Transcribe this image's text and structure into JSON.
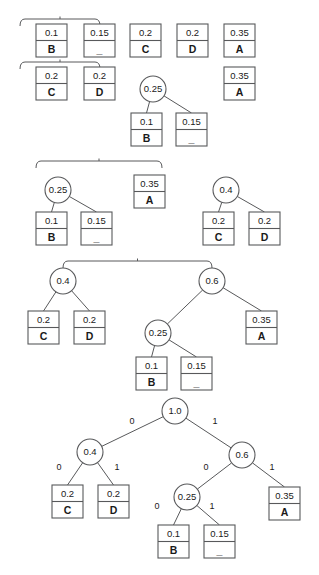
{
  "diagram": {
    "symbols": [
      "A",
      "B",
      "C",
      "D",
      "_"
    ],
    "probabilities": {
      "A": "0.35",
      "B": "0.1",
      "C": "0.2",
      "D": "0.2",
      "_": "0.15"
    },
    "edge_label_left": "0",
    "edge_label_right": "1",
    "colors": {
      "stroke": "#58595b",
      "text": "#1a1a1a",
      "background": "#ffffff"
    }
  },
  "steps": [
    {
      "step": 1,
      "name": "initial-symbol-list",
      "leaves": [
        {
          "prob": "0.1",
          "sym": "B",
          "x": 36,
          "y": 24
        },
        {
          "prob": "0.15",
          "sym": "_",
          "x": 84,
          "y": 24
        },
        {
          "prob": "0.2",
          "sym": "C",
          "x": 130,
          "y": 24
        },
        {
          "prob": "0.2",
          "sym": "D",
          "x": 177,
          "y": 24
        },
        {
          "prob": "0.35",
          "sym": "A",
          "x": 224,
          "y": 24
        }
      ],
      "brace": {
        "x1": 20,
        "x2": 100,
        "y": 19
      }
    },
    {
      "step": 2,
      "name": "merge-B-and-blank",
      "leaves": [
        {
          "prob": "0.2",
          "sym": "C",
          "x": 36,
          "y": 67
        },
        {
          "prob": "0.2",
          "sym": "D",
          "x": 84,
          "y": 67
        },
        {
          "prob": "0.35",
          "sym": "A",
          "x": 224,
          "y": 67
        },
        {
          "prob": "0.1",
          "sym": "B",
          "x": 131,
          "y": 113
        },
        {
          "prob": "0.15",
          "sym": "_",
          "x": 176,
          "y": 113
        }
      ],
      "internal": [
        {
          "prob": "0.25",
          "cx": 153,
          "cy": 89
        }
      ],
      "brace": {
        "x1": 20,
        "x2": 100,
        "y": 62
      }
    },
    {
      "step": 3,
      "name": "merge-C-and-D",
      "leaves": [
        {
          "prob": "0.35",
          "sym": "A",
          "x": 134,
          "y": 175
        },
        {
          "prob": "0.1",
          "sym": "B",
          "x": 36,
          "y": 212
        },
        {
          "prob": "0.15",
          "sym": "_",
          "x": 81,
          "y": 212
        },
        {
          "prob": "0.2",
          "sym": "C",
          "x": 203,
          "y": 212
        },
        {
          "prob": "0.2",
          "sym": "D",
          "x": 249,
          "y": 212
        }
      ],
      "internal": [
        {
          "prob": "0.25",
          "cx": 58,
          "cy": 190
        },
        {
          "prob": "0.4",
          "cx": 226,
          "cy": 190
        }
      ],
      "brace": {
        "x1": 36,
        "x2": 162,
        "y": 161
      }
    },
    {
      "step": 4,
      "name": "merge-025-and-A",
      "leaves": [
        {
          "prob": "0.2",
          "sym": "C",
          "x": 28,
          "y": 311
        },
        {
          "prob": "0.2",
          "sym": "D",
          "x": 74,
          "y": 311
        },
        {
          "prob": "0.35",
          "sym": "A",
          "x": 246,
          "y": 311
        },
        {
          "prob": "0.1",
          "sym": "B",
          "x": 136,
          "y": 357
        },
        {
          "prob": "0.15",
          "sym": "_",
          "x": 181,
          "y": 357
        }
      ],
      "internal": [
        {
          "prob": "0.4",
          "cx": 63,
          "cy": 281
        },
        {
          "prob": "0.6",
          "cx": 212,
          "cy": 281
        },
        {
          "prob": "0.25",
          "cx": 158,
          "cy": 333
        }
      ],
      "brace": {
        "x1": 63,
        "x2": 212,
        "y": 261
      }
    },
    {
      "step": 5,
      "name": "final-huffman-tree",
      "leaves": [
        {
          "prob": "0.2",
          "sym": "C",
          "x": 52,
          "y": 485
        },
        {
          "prob": "0.2",
          "sym": "D",
          "x": 98,
          "y": 485
        },
        {
          "prob": "0.35",
          "sym": "A",
          "x": 269,
          "y": 487
        },
        {
          "prob": "0.1",
          "sym": "B",
          "x": 158,
          "y": 525
        },
        {
          "prob": "0.15",
          "sym": "_",
          "x": 204,
          "y": 525
        }
      ],
      "internal": [
        {
          "prob": "1.0",
          "cx": 175,
          "cy": 411
        },
        {
          "prob": "0.4",
          "cx": 90,
          "cy": 452
        },
        {
          "prob": "0.6",
          "cx": 242,
          "cy": 455
        },
        {
          "prob": "0.25",
          "cx": 187,
          "cy": 497
        }
      ],
      "edge_labels": [
        {
          "text": "0",
          "x": 132,
          "y": 424
        },
        {
          "text": "1",
          "x": 215,
          "y": 424
        },
        {
          "text": "0",
          "x": 59,
          "y": 470
        },
        {
          "text": "1",
          "x": 117,
          "y": 470
        },
        {
          "text": "0",
          "x": 206,
          "y": 470
        },
        {
          "text": "1",
          "x": 272,
          "y": 470
        },
        {
          "text": "0",
          "x": 157,
          "y": 509
        },
        {
          "text": "1",
          "x": 212,
          "y": 509
        }
      ]
    }
  ]
}
